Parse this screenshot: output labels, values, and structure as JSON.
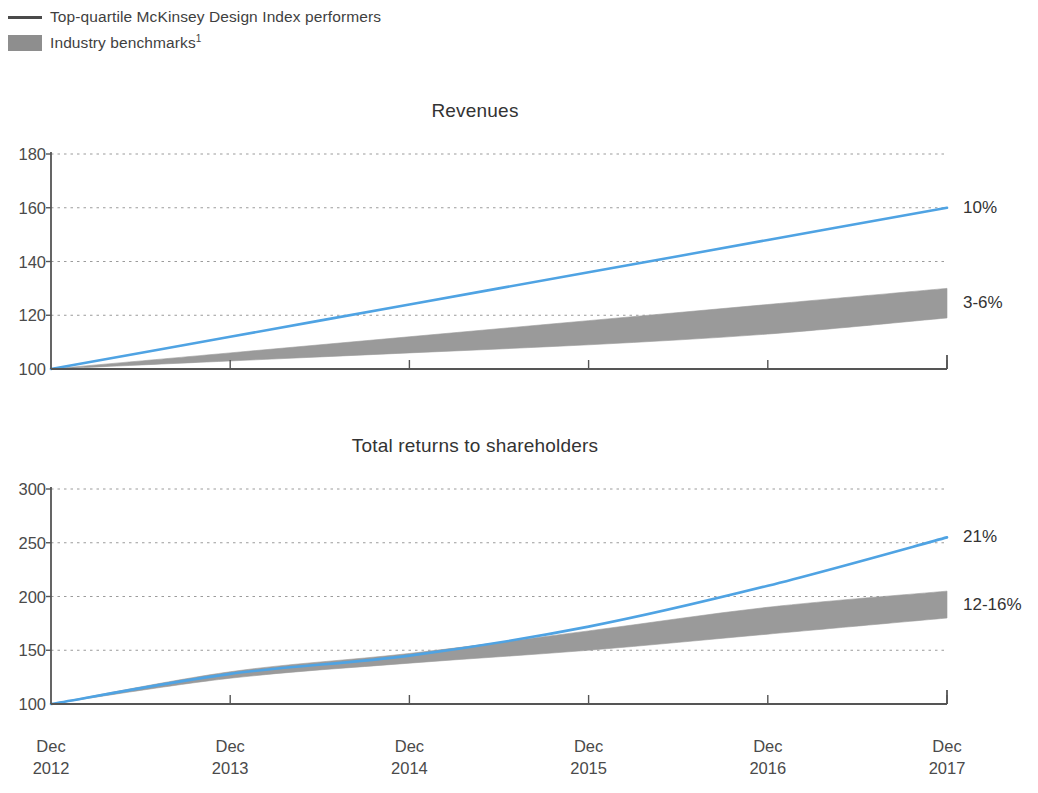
{
  "legend": {
    "items": [
      {
        "marker": "line",
        "marker_color": "#4a4a4a",
        "label": "Top-quartile McKinsey Design Index performers",
        "footnote": ""
      },
      {
        "marker": "swatch",
        "marker_color": "#8e8e8e",
        "label": "Industry benchmarks",
        "footnote": "1"
      }
    ]
  },
  "colors": {
    "line_blue": "#4FA3E3",
    "band_gray": "#9a9a9a",
    "axis": "#555555",
    "gridline": "#9b9b9b",
    "text": "#3b3b3b"
  },
  "chart_data": [
    {
      "type": "line",
      "title": "Revenues",
      "xlabel": "",
      "ylabel": "",
      "x": [
        "Dec 2012",
        "Dec 2013",
        "Dec 2014",
        "Dec 2015",
        "Dec 2016",
        "Dec 2017"
      ],
      "xtick_labels": [
        {
          "month": "Dec",
          "year": "2012"
        },
        {
          "month": "Dec",
          "year": "2013"
        },
        {
          "month": "Dec",
          "year": "2014"
        },
        {
          "month": "Dec",
          "year": "2015"
        },
        {
          "month": "Dec",
          "year": "2016"
        },
        {
          "month": "Dec",
          "year": "2017"
        }
      ],
      "ylim": [
        100,
        180
      ],
      "yticks": [
        100,
        120,
        140,
        160,
        180
      ],
      "grid": true,
      "series": [
        {
          "name": "Top-quartile McKinsey Design Index performers",
          "kind": "line",
          "color": "#4FA3E3",
          "values": [
            100,
            112,
            124,
            136,
            148,
            160
          ],
          "annotation": "10%"
        },
        {
          "name": "Industry benchmarks",
          "kind": "band",
          "color": "#9a9a9a",
          "upper": [
            100,
            106,
            112,
            118,
            124,
            130
          ],
          "lower": [
            100,
            103,
            106,
            109,
            113,
            119
          ],
          "annotation": "3-6%"
        }
      ]
    },
    {
      "type": "line",
      "title": "Total returns to shareholders",
      "xlabel": "",
      "ylabel": "",
      "x": [
        "Dec 2012",
        "Dec 2013",
        "Dec 2014",
        "Dec 2015",
        "Dec 2016",
        "Dec 2017"
      ],
      "xtick_labels": [
        {
          "month": "Dec",
          "year": "2012"
        },
        {
          "month": "Dec",
          "year": "2013"
        },
        {
          "month": "Dec",
          "year": "2014"
        },
        {
          "month": "Dec",
          "year": "2015"
        },
        {
          "month": "Dec",
          "year": "2016"
        },
        {
          "month": "Dec",
          "year": "2017"
        }
      ],
      "ylim": [
        100,
        300
      ],
      "yticks": [
        100,
        150,
        200,
        250,
        300
      ],
      "grid": true,
      "series": [
        {
          "name": "Top-quartile McKinsey Design Index performers",
          "kind": "line",
          "color": "#4FA3E3",
          "values": [
            100,
            128,
            145,
            172,
            210,
            255
          ],
          "annotation": "21%"
        },
        {
          "name": "Industry benchmarks",
          "kind": "band",
          "color": "#9a9a9a",
          "upper": [
            100,
            130,
            147,
            168,
            190,
            205
          ],
          "lower": [
            100,
            124,
            138,
            150,
            165,
            180
          ],
          "annotation": "12-16%"
        }
      ]
    }
  ]
}
